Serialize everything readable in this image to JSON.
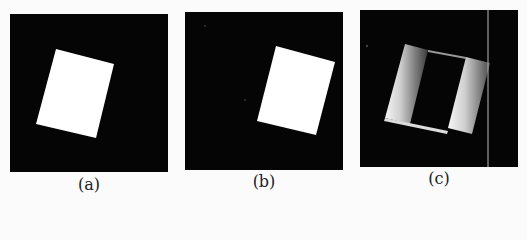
{
  "figure": {
    "panels": [
      {
        "id": "a",
        "caption": "(a)",
        "description": "white rotated rectangle on black background"
      },
      {
        "id": "b",
        "caption": "(b)",
        "description": "translated white rotated rectangle on black background"
      },
      {
        "id": "c",
        "caption": "(c)",
        "description": "difference image showing gray gradient edges of moved rectangle"
      }
    ]
  }
}
